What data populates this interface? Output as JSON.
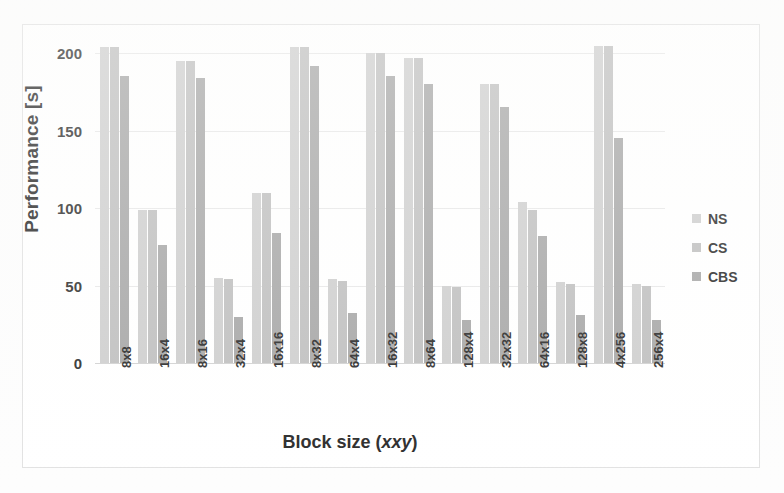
{
  "chart_data": {
    "type": "bar",
    "title": "",
    "xlabel": "Block size (xxy)",
    "ylabel": "Performance [s]",
    "ylim": [
      0,
      215
    ],
    "yticks": [
      0,
      50,
      100,
      150,
      200
    ],
    "grid": true,
    "legend_position": "right",
    "categories": [
      "8x8",
      "16x4",
      "8x16",
      "32x4",
      "16x16",
      "8x32",
      "64x4",
      "16x32",
      "8x64",
      "128x4",
      "32x32",
      "64x16",
      "128x8",
      "4x256",
      "256x4"
    ],
    "series": [
      {
        "name": "NS",
        "color": "#cfcfcf",
        "values": [
          204,
          99,
          195,
          55,
          110,
          204,
          54,
          200,
          197,
          50,
          180,
          104,
          52,
          205,
          51
        ]
      },
      {
        "name": "CS",
        "color": "#c0c0c0",
        "values": [
          204,
          99,
          195,
          54,
          110,
          204,
          53,
          200,
          197,
          49,
          180,
          99,
          51,
          205,
          50
        ]
      },
      {
        "name": "CBS",
        "color": "#a8a8a8",
        "values": [
          185,
          76,
          184,
          30,
          84,
          192,
          32,
          185,
          180,
          28,
          165,
          82,
          31,
          145,
          28
        ]
      }
    ]
  },
  "axes": {
    "y_title": "Performance [s]",
    "x_title_prefix": "Block size (",
    "x_title_italic_x": "x",
    "x_title_mid": "x",
    "x_title_italic_y": "y",
    "x_title_suffix": ")",
    "ytick_labels": [
      "200",
      "150",
      "100",
      "50",
      "0"
    ],
    "xtick_labels": [
      "8x8",
      "16x4",
      "8x16",
      "32x4",
      "16x16",
      "8x32",
      "64x4",
      "16x32",
      "8x64",
      "128x4",
      "32x32",
      "64x16",
      "128x8",
      "4x256",
      "256x4"
    ]
  },
  "legend": {
    "items": [
      {
        "label": "NS",
        "color": "#cfcfcf"
      },
      {
        "label": "CS",
        "color": "#c0c0c0"
      },
      {
        "label": "CBS",
        "color": "#a8a8a8"
      }
    ]
  }
}
